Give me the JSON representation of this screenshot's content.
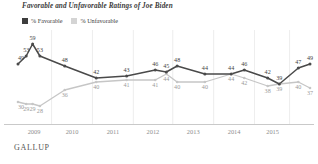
{
  "title": "Favorable and Unfavorable Ratings of Joe Biden",
  "footer": "GALLUP",
  "legend": [
    {
      "label": "% Favorable",
      "color": "#3d3d3d",
      "swatch_name": "legend-swatch-favorable"
    },
    {
      "label": "% Unfavorable",
      "color": "#cfcfcf",
      "swatch_name": "legend-swatch-unfavorable"
    }
  ],
  "chart_data": {
    "type": "line",
    "title": "Favorable and Unfavorable Ratings of Joe Biden",
    "xlabel": "",
    "ylabel": "",
    "ylim": [
      25,
      62
    ],
    "grid": "vertical-year-separators",
    "legend_position": "top-left",
    "x_tick_labels": [
      "2009",
      "2010",
      "2011",
      "2012",
      "2013",
      "2014",
      "2015"
    ],
    "x": [
      "2009-01",
      "2009-02",
      "2009-03",
      "2009-05",
      "2009-09",
      "2010-07",
      "2011-06",
      "2012-02",
      "2012-09",
      "2012-11",
      "2013-06",
      "2014-02",
      "2014-06",
      "2015-03",
      "2015-07",
      "2015-09",
      "2015-10"
    ],
    "series": [
      {
        "name": "% Favorable",
        "color": "#4a4a4a",
        "values": [
          49,
          53,
          59,
          53,
          48,
          42,
          43,
          46,
          45,
          48,
          44,
          44,
          46,
          42,
          39,
          47,
          49
        ],
        "labels": [
          "49",
          "53",
          "59",
          "53",
          "48",
          "42",
          "43",
          "46",
          "45",
          "48",
          "44",
          "44",
          "46",
          "42",
          "39",
          "47",
          "49"
        ]
      },
      {
        "name": "% Unfavorable",
        "color": "#c6c6c6",
        "values": [
          30,
          29,
          29,
          28,
          36,
          40,
          41,
          41,
          44,
          40,
          40,
          44,
          42,
          38,
          39,
          40,
          37
        ],
        "labels": [
          "30",
          "29",
          "29",
          "28",
          "36",
          "40",
          "41",
          "41",
          "44",
          "40",
          "40",
          "44",
          "42",
          "38",
          "39",
          "40",
          "37"
        ]
      }
    ]
  }
}
